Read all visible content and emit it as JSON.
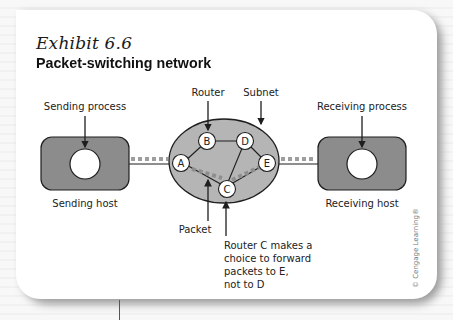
{
  "exhibit": {
    "number": "Exhibit 6.6",
    "title": "Packet-switching network"
  },
  "labels": {
    "sending_process": "Sending process",
    "sending_host": "Sending host",
    "router": "Router",
    "subnet": "Subnet",
    "receiving_process": "Receiving process",
    "receiving_host": "Receiving host",
    "packet": "Packet",
    "router_c_note": [
      "Router C makes a",
      "choice to forward",
      "packets to E,",
      "not to D"
    ]
  },
  "routers": [
    {
      "id": "A",
      "label": "A"
    },
    {
      "id": "B",
      "label": "B"
    },
    {
      "id": "C",
      "label": "C"
    },
    {
      "id": "D",
      "label": "D"
    },
    {
      "id": "E",
      "label": "E"
    }
  ],
  "links": [
    [
      "A",
      "B"
    ],
    [
      "B",
      "D"
    ],
    [
      "D",
      "E"
    ],
    [
      "A",
      "C"
    ],
    [
      "C",
      "D"
    ],
    [
      "C",
      "E"
    ]
  ],
  "copyright": "© Cengage Learning®",
  "colors": {
    "host_fill": "#8c8c8c",
    "subnet_fill": "#b5b5b5",
    "packet_dash": "#9e9e9e",
    "outline": "#1e1e1e"
  }
}
